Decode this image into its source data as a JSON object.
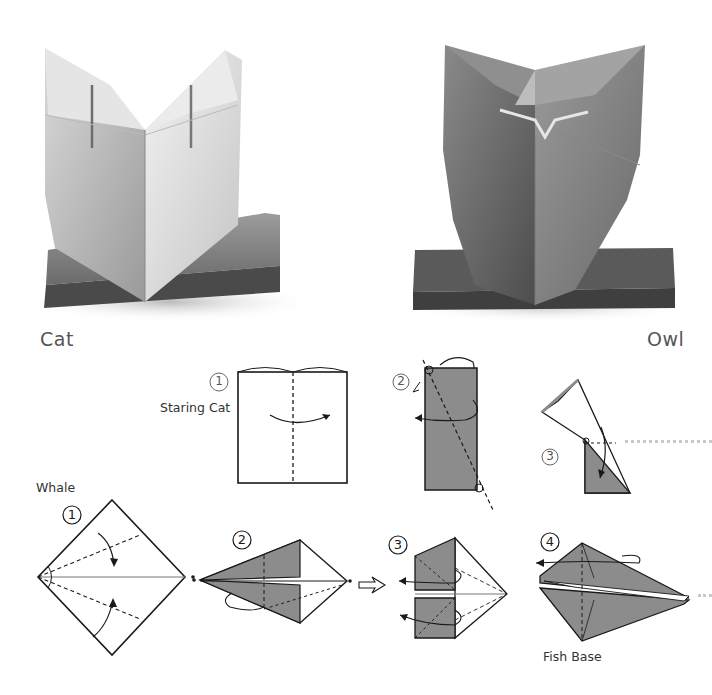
{
  "photos": [
    {
      "id": "cat",
      "label": "Cat"
    },
    {
      "id": "owl",
      "label": "Owl"
    }
  ],
  "diagrams": {
    "staring_cat": {
      "title": "Staring Cat",
      "steps": [
        {
          "number": "1"
        },
        {
          "number": "2"
        },
        {
          "number": "3"
        }
      ]
    },
    "whale": {
      "title": "Whale",
      "steps": [
        {
          "number": "1"
        },
        {
          "number": "2"
        },
        {
          "number": "3"
        },
        {
          "number": "4",
          "caption": "Fish Base"
        }
      ]
    }
  },
  "colors": {
    "paper_shaded": "#8c8c8c",
    "line": "#1a1a1a",
    "dotted_connector": "#c8c8c8"
  }
}
